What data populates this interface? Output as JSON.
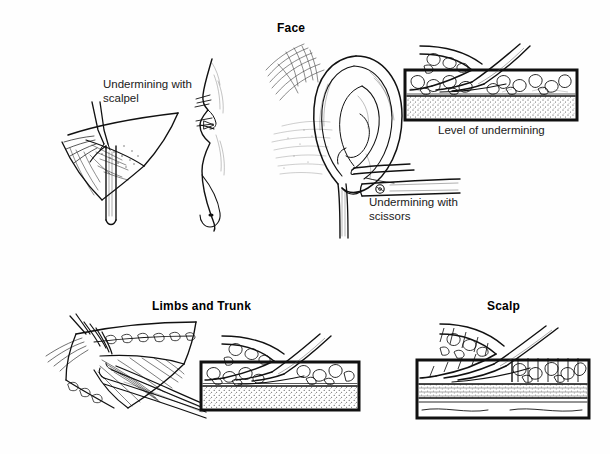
{
  "plate": {
    "title_visible": false,
    "background_color": "#fefefe",
    "ink_color": "#111111",
    "style": "pen-and-ink medical illustration"
  },
  "sections": [
    {
      "id": "face",
      "label": "Face"
    },
    {
      "id": "limbs",
      "label": "Limbs and Trunk"
    },
    {
      "id": "scalp",
      "label": "Scalp"
    }
  ],
  "labels": [
    {
      "id": "scalpel",
      "text": "Undermining with\nscalpel"
    },
    {
      "id": "scissors",
      "text": "Undermining with\nscissors"
    },
    {
      "id": "level",
      "text": "Level of undermining"
    }
  ],
  "figures": [
    {
      "id": "face-flap-scalpel",
      "caption_ref": "scalpel",
      "description": "Triangular skin flap elevated with toothed forceps while a scalpel undermines the subcutaneous plane"
    },
    {
      "id": "face-profile",
      "description": "Lateral facial profile showing nose with sutured incision line"
    },
    {
      "id": "ear-scissors",
      "caption_ref": "scissors",
      "description": "Auricle retracted forward with scissors undermining the postauricular skin"
    },
    {
      "id": "face-cross-section",
      "caption_ref": "level",
      "description": "Cross-section block: scissors dissecting through subcutaneous fat just above the deeper stippled layer"
    },
    {
      "id": "limbs-flap",
      "description": "Limb flap held by forceps with scissors undermining above the fascia over striated muscle"
    },
    {
      "id": "limbs-cross-section",
      "description": "Cross-section block: undermining plane at the deep subcutaneous fat over fascia"
    },
    {
      "id": "scalp-cross-section",
      "description": "Scalp cross-section with hair follicles, showing undermining in the subgaleal plane beneath the galea aponeurotica"
    }
  ],
  "layers": {
    "fat": "subcutaneous fat (cobblestone texture)",
    "deep": "deep layer (stippled)",
    "galea": "galea aponeurotica",
    "muscle": "muscle"
  }
}
